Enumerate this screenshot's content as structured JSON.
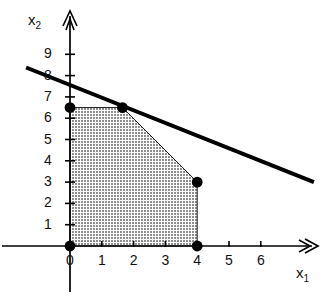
{
  "chart_data": {
    "type": "area",
    "title": "",
    "xlabel": "x1",
    "ylabel": "x2",
    "xlabel_display": "x",
    "xlabel_sub": "1",
    "ylabel_display": "x",
    "ylabel_sub": "2",
    "xlim": [
      0,
      6.8
    ],
    "ylim": [
      0,
      9.8
    ],
    "grid": false,
    "legend": "none",
    "xticks": [
      0,
      1,
      2,
      3,
      4,
      5,
      6
    ],
    "xtick_labels": [
      "0",
      "1",
      "2",
      "3",
      "4",
      "5",
      "6"
    ],
    "yticks": [
      1,
      2,
      3,
      4,
      5,
      6,
      7,
      8,
      9
    ],
    "ytick_labels": [
      "1",
      "2",
      "3",
      "4",
      "5",
      "6",
      "7",
      "8",
      "9"
    ],
    "feasible_region": {
      "name": "feasible-region",
      "fill": "#bdbdbd",
      "vertices": [
        {
          "x": 0,
          "y": 0
        },
        {
          "x": 0,
          "y": 6.5
        },
        {
          "x": 1.65,
          "y": 6.5
        },
        {
          "x": 4,
          "y": 3
        },
        {
          "x": 4,
          "y": 0
        }
      ]
    },
    "marked_vertices": [
      {
        "x": 0,
        "y": 0,
        "label": ""
      },
      {
        "x": 0,
        "y": 6.5,
        "label": ""
      },
      {
        "x": 1.65,
        "y": 6.5,
        "label": ""
      },
      {
        "x": 4,
        "y": 3,
        "label": ""
      },
      {
        "x": 4,
        "y": 0,
        "label": ""
      }
    ],
    "objective_line": {
      "name": "objective-line",
      "color": "#000000",
      "width": 4,
      "from": {
        "x": -1.38,
        "y": 8.38
      },
      "to": {
        "x": 7.67,
        "y": 3.0
      }
    },
    "axis_color": "#000000"
  }
}
